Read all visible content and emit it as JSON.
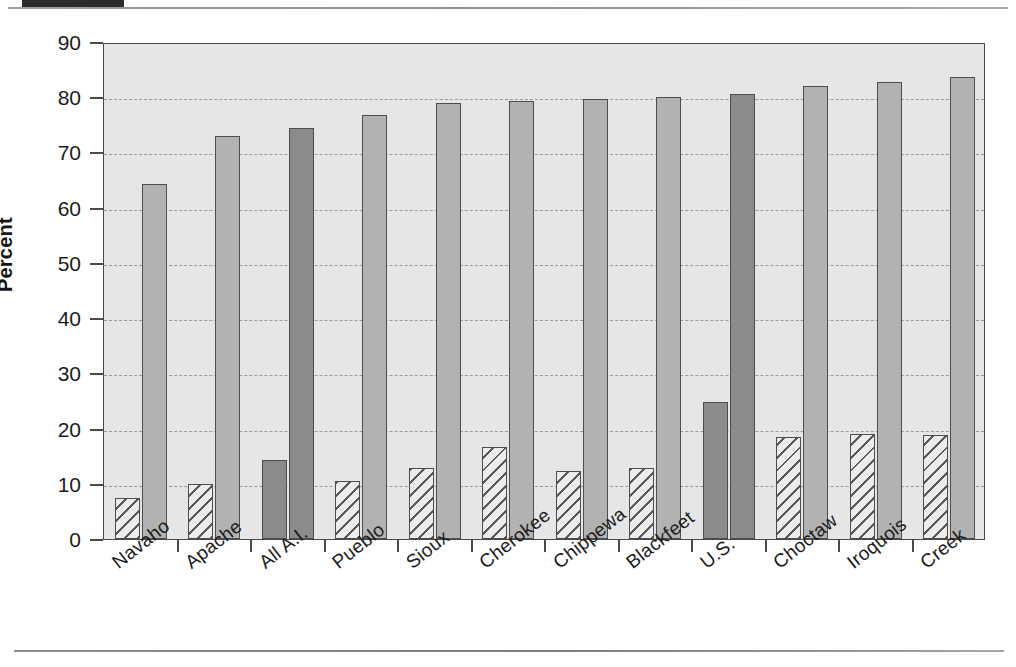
{
  "figure": {
    "y_axis_title": "Percent",
    "y_ticks": [
      "0",
      "10",
      "20",
      "30",
      "40",
      "50",
      "60",
      "70",
      "80",
      "90"
    ],
    "plot_background": "#e6e6e6",
    "series_light_color": "#b2b2b2",
    "series_dark_color": "#8b8b8b",
    "hatch_color": "#5a5a5a"
  },
  "chart_data": {
    "type": "bar",
    "title": "",
    "xlabel": "",
    "ylabel": "Percent",
    "ylim": [
      0,
      90
    ],
    "ytick_step": 10,
    "grid": true,
    "legend": "none",
    "categories": [
      "Navaho",
      "Apache",
      "All A.I.",
      "Pueblo",
      "Sioux",
      "Cherokee",
      "Chippewa",
      "Blackfeet",
      "U.S.",
      "Choctaw",
      "Iroquois",
      "Creek"
    ],
    "highlighted_categories": [
      "All A.I.",
      "U.S."
    ],
    "series": [
      {
        "name": "series-1-hatched",
        "style": "hatched",
        "values": [
          7.4,
          10.0,
          14.3,
          10.5,
          12.9,
          16.7,
          12.3,
          12.9,
          24.8,
          18.5,
          19.1,
          18.9
        ]
      },
      {
        "name": "series-2-solid",
        "style": "solid",
        "values": [
          64.2,
          72.9,
          74.4,
          76.8,
          78.9,
          79.3,
          79.7,
          80.1,
          80.5,
          82.0,
          82.8,
          83.6
        ]
      }
    ]
  }
}
